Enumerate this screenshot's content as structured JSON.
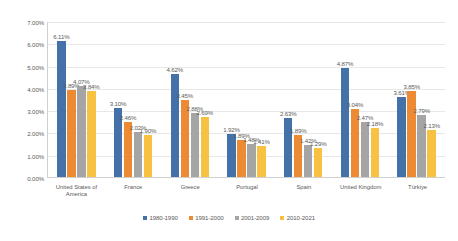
{
  "chart_data": {
    "type": "bar",
    "title": "",
    "xlabel": "",
    "ylabel": "",
    "ylim": [
      0,
      7
    ],
    "ytick_labels": [
      "7.00%",
      "6.00%",
      "5.00%",
      "4.00%",
      "3.00%",
      "2.00%",
      "1.00%",
      "0.00%"
    ],
    "ytick_values": [
      7,
      6,
      5,
      4,
      3,
      2,
      1,
      0
    ],
    "grid": true,
    "legend_position": "bottom",
    "value_suffix": "%",
    "categories": [
      "United States of America",
      "France",
      "Greece",
      "Portugal",
      "Spain",
      "United Kingdom",
      "Türkiye"
    ],
    "series": [
      {
        "name": "1980-1990",
        "color": "#4472a8",
        "values": [
          6.11,
          3.1,
          4.62,
          1.92,
          2.63,
          4.87,
          3.61
        ],
        "labels": [
          "6.11%",
          "3.10%",
          "4.62%",
          "1.92%",
          "2.63%",
          "4.87%",
          "3.61%"
        ]
      },
      {
        "name": "1991-2000",
        "color": "#ed8b34",
        "values": [
          3.89,
          2.46,
          3.45,
          1.65,
          1.89,
          3.04,
          3.85
        ],
        "labels": [
          "3.89%",
          "2.46%",
          "3.45%",
          "1.89%",
          "1.89%",
          "3.04%",
          "3.85%"
        ]
      },
      {
        "name": "2001-2009",
        "color": "#a5a5a5",
        "values": [
          4.07,
          2.02,
          2.88,
          1.48,
          1.42,
          2.47,
          2.79
        ],
        "labels": [
          "4.07%",
          "2.02%",
          "2.88%",
          "1.48%",
          "1.42%",
          "2.47%",
          "2.79%"
        ]
      },
      {
        "name": "2010-2021",
        "color": "#f7c142",
        "values": [
          3.84,
          1.9,
          2.69,
          1.41,
          1.29,
          2.18,
          2.13
        ],
        "labels": [
          "3.84%",
          "1.90%",
          "2.69%",
          "1.41%",
          "1.29%",
          "2.18%",
          "2.13%"
        ]
      }
    ]
  }
}
